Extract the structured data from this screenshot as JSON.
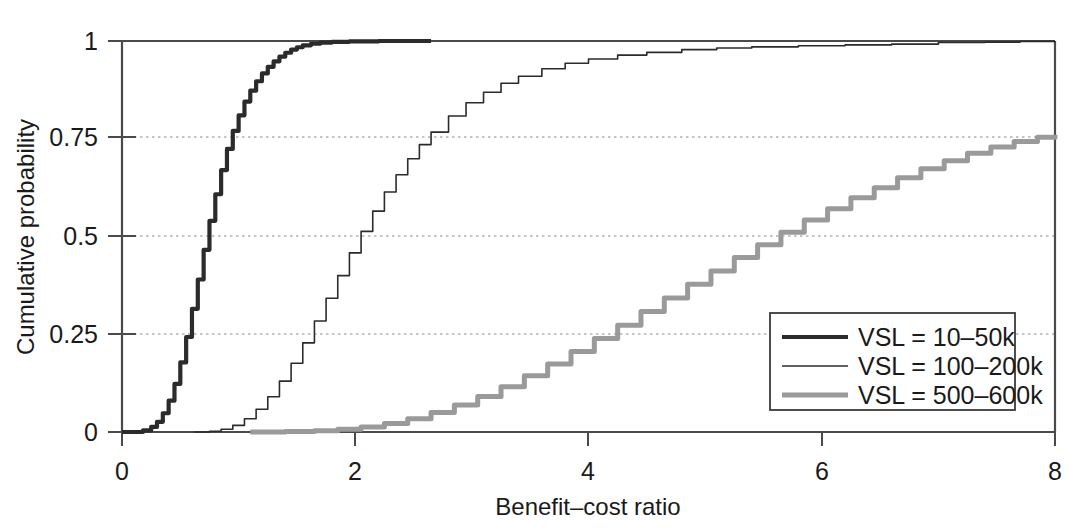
{
  "chart_data": {
    "type": "line",
    "title": "",
    "xlabel": "Benefit–cost ratio",
    "ylabel": "Cumulative probability",
    "xlim": [
      0,
      8
    ],
    "ylim": [
      0,
      1
    ],
    "xticks": [
      "0",
      "2",
      "4",
      "6",
      "8"
    ],
    "xtick_values": [
      0,
      2,
      4,
      6,
      8
    ],
    "yticks": [
      "0",
      "0.25",
      "0.5",
      "0.75",
      "1"
    ],
    "ytick_values": [
      0,
      0.25,
      0.5,
      0.75,
      1
    ],
    "grid": "horizontal-dotted",
    "legend_position": "bottom-right",
    "series": [
      {
        "name": "VSL = 10–50k",
        "color": "#2b2b2b",
        "width": 4.2,
        "points": [
          [
            0.0,
            0.0
          ],
          [
            0.1,
            0.0
          ],
          [
            0.18,
            0.004
          ],
          [
            0.25,
            0.013
          ],
          [
            0.3,
            0.026
          ],
          [
            0.35,
            0.048
          ],
          [
            0.4,
            0.08
          ],
          [
            0.45,
            0.123
          ],
          [
            0.5,
            0.178
          ],
          [
            0.55,
            0.243
          ],
          [
            0.6,
            0.315
          ],
          [
            0.65,
            0.39
          ],
          [
            0.7,
            0.466
          ],
          [
            0.75,
            0.54
          ],
          [
            0.8,
            0.608
          ],
          [
            0.85,
            0.67
          ],
          [
            0.9,
            0.724
          ],
          [
            0.95,
            0.77
          ],
          [
            1.0,
            0.81
          ],
          [
            1.05,
            0.845
          ],
          [
            1.1,
            0.873
          ],
          [
            1.15,
            0.897
          ],
          [
            1.2,
            0.917
          ],
          [
            1.25,
            0.934
          ],
          [
            1.3,
            0.948
          ],
          [
            1.35,
            0.96
          ],
          [
            1.4,
            0.97
          ],
          [
            1.45,
            0.978
          ],
          [
            1.5,
            0.984
          ],
          [
            1.55,
            0.989
          ],
          [
            1.62,
            0.993
          ],
          [
            1.7,
            0.996
          ],
          [
            1.8,
            0.998
          ],
          [
            1.95,
            0.999
          ],
          [
            2.2,
            1.0
          ],
          [
            2.65,
            1.0
          ]
        ]
      },
      {
        "name": "VSL = 100–200k",
        "color": "#2b2b2b",
        "width": 1.6,
        "points": [
          [
            0.62,
            0.0
          ],
          [
            0.75,
            0.002
          ],
          [
            0.85,
            0.007
          ],
          [
            0.95,
            0.017
          ],
          [
            1.05,
            0.034
          ],
          [
            1.15,
            0.058
          ],
          [
            1.25,
            0.09
          ],
          [
            1.35,
            0.13
          ],
          [
            1.45,
            0.176
          ],
          [
            1.55,
            0.228
          ],
          [
            1.65,
            0.284
          ],
          [
            1.75,
            0.342
          ],
          [
            1.85,
            0.4
          ],
          [
            1.95,
            0.458
          ],
          [
            2.05,
            0.513
          ],
          [
            2.15,
            0.565
          ],
          [
            2.25,
            0.614
          ],
          [
            2.35,
            0.658
          ],
          [
            2.45,
            0.699
          ],
          [
            2.55,
            0.735
          ],
          [
            2.65,
            0.767
          ],
          [
            2.8,
            0.808
          ],
          [
            2.95,
            0.842
          ],
          [
            3.1,
            0.869
          ],
          [
            3.25,
            0.892
          ],
          [
            3.4,
            0.91
          ],
          [
            3.6,
            0.929
          ],
          [
            3.8,
            0.943
          ],
          [
            4.0,
            0.954
          ],
          [
            4.25,
            0.964
          ],
          [
            4.5,
            0.971
          ],
          [
            4.8,
            0.978
          ],
          [
            5.1,
            0.982
          ],
          [
            5.4,
            0.985
          ],
          [
            5.8,
            0.988
          ],
          [
            6.2,
            0.99
          ],
          [
            6.6,
            0.992
          ],
          [
            7.0,
            0.996
          ],
          [
            7.4,
            0.997
          ],
          [
            7.7,
            0.999
          ],
          [
            8.0,
            1.0
          ]
        ]
      },
      {
        "name": "VSL = 500–600k",
        "color": "#9a9a9a",
        "width": 5.0,
        "points": [
          [
            1.1,
            0.0
          ],
          [
            1.4,
            0.001
          ],
          [
            1.65,
            0.003
          ],
          [
            1.85,
            0.007
          ],
          [
            2.05,
            0.013
          ],
          [
            2.25,
            0.022
          ],
          [
            2.45,
            0.034
          ],
          [
            2.65,
            0.05
          ],
          [
            2.85,
            0.069
          ],
          [
            3.05,
            0.091
          ],
          [
            3.25,
            0.116
          ],
          [
            3.45,
            0.144
          ],
          [
            3.65,
            0.174
          ],
          [
            3.85,
            0.206
          ],
          [
            4.05,
            0.239
          ],
          [
            4.25,
            0.273
          ],
          [
            4.45,
            0.308
          ],
          [
            4.65,
            0.343
          ],
          [
            4.85,
            0.378
          ],
          [
            5.05,
            0.412
          ],
          [
            5.25,
            0.446
          ],
          [
            5.45,
            0.479
          ],
          [
            5.65,
            0.511
          ],
          [
            5.85,
            0.542
          ],
          [
            6.05,
            0.571
          ],
          [
            6.25,
            0.599
          ],
          [
            6.45,
            0.625
          ],
          [
            6.65,
            0.65
          ],
          [
            6.85,
            0.673
          ],
          [
            7.05,
            0.694
          ],
          [
            7.25,
            0.713
          ],
          [
            7.45,
            0.729
          ],
          [
            7.65,
            0.743
          ],
          [
            7.85,
            0.754
          ],
          [
            8.0,
            0.76
          ]
        ]
      }
    ]
  },
  "legend": {
    "items": [
      {
        "label": "VSL = 10–50k"
      },
      {
        "label": "VSL = 100–200k"
      },
      {
        "label": "VSL = 500–600k"
      }
    ]
  },
  "colors": {
    "axis": "#4a4a4a",
    "grid": "#8c8c8c",
    "text": "#1a1a1a",
    "series_dark": "#2b2b2b",
    "series_gray": "#9a9a9a",
    "legend_border": "#3a3a3a",
    "background": "#ffffff"
  }
}
